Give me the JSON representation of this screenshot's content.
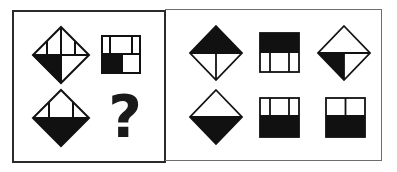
{
  "puzzle": {
    "question_panel": {
      "figures": [
        {
          "id": "q1",
          "shape": "diamond",
          "description": "diamond with horizontal midline, vertical center line, two short verticals in top half; bottom-left quarter filled black"
        },
        {
          "id": "q2",
          "shape": "square",
          "description": "square with horizontal midline, two verticals in top half; bottom-left cell filled black"
        },
        {
          "id": "q3",
          "shape": "diamond",
          "description": "diamond with horizontal midline, two short verticals in top half; bottom half filled black"
        }
      ],
      "unknown_label": "?"
    },
    "options_panel": {
      "figures": [
        {
          "id": "o1",
          "shape": "diamond",
          "description": "top half black, vertical line in bottom half"
        },
        {
          "id": "o2",
          "shape": "square",
          "description": "top half black, two verticals in bottom half"
        },
        {
          "id": "o3",
          "shape": "diamond",
          "description": "horizontal midline, vertical in bottom half, bottom-left quarter black"
        },
        {
          "id": "o4",
          "shape": "diamond",
          "description": "bottom half black, no other lines"
        },
        {
          "id": "o5",
          "shape": "square",
          "description": "two verticals in top half, bottom half black"
        },
        {
          "id": "o6",
          "shape": "square",
          "description": "one vertical in top half, bottom half black"
        }
      ]
    },
    "colors": {
      "fill": "#111111",
      "stroke": "#111111",
      "background": "#ffffff"
    }
  }
}
